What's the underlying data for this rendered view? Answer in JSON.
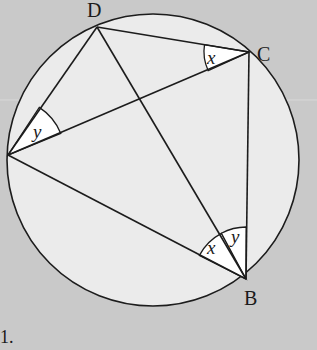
{
  "diagram": {
    "type": "cyclic-quadrilateral-angles",
    "colors": {
      "background": "#c9c9c9",
      "circle_fill": "#ebebeb",
      "stroke": "#1c1c1c",
      "angle_fill": "#ffffff"
    },
    "circle": {
      "cx": 153,
      "cy": 160,
      "r": 146
    },
    "points": {
      "A": {
        "x": 8,
        "y": 155,
        "label": ""
      },
      "B": {
        "x": 246,
        "y": 279,
        "label": "B"
      },
      "C": {
        "x": 249,
        "y": 52,
        "label": "C"
      },
      "D": {
        "x": 97,
        "y": 27,
        "label": "D"
      }
    },
    "labels": {
      "D": "D",
      "C": "C",
      "B": "B"
    },
    "segments": [
      [
        "D",
        "C"
      ],
      [
        "D",
        "A"
      ],
      [
        "A",
        "C"
      ],
      [
        "A",
        "B"
      ],
      [
        "D",
        "B"
      ],
      [
        "C",
        "B"
      ]
    ],
    "angles": [
      {
        "vertex": "C",
        "between": [
          "D",
          "A"
        ],
        "label": "x"
      },
      {
        "vertex": "A",
        "between": [
          "D",
          "C"
        ],
        "label": "y"
      },
      {
        "vertex": "B",
        "between": [
          "A",
          "D"
        ],
        "label": "x"
      },
      {
        "vertex": "B",
        "between": [
          "D",
          "C"
        ],
        "label": "y"
      }
    ],
    "angle_labels": {
      "x_at_C": "x",
      "y_at_A": "y",
      "x_at_B": "x",
      "y_at_B": "y"
    },
    "fragment_text": "1."
  }
}
